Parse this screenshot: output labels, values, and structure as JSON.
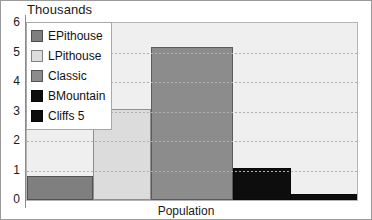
{
  "chart_data": {
    "type": "bar",
    "title": "Thousands",
    "xlabel": "Population",
    "ylabel": "",
    "ylim": [
      0,
      6
    ],
    "yticks": [
      0,
      1,
      2,
      3,
      4,
      5,
      6
    ],
    "grid": true,
    "legend_position": "top-left-inside",
    "categories": [
      "EPithouse",
      "LPithouse",
      "Classic",
      "BMountain",
      "Cliffs 5"
    ],
    "values": [
      0.8,
      3.1,
      5.2,
      1.1,
      0.2
    ],
    "colors": [
      "#7f7f7f",
      "#dcdcdc",
      "#8c8c8c",
      "#0d0d0d",
      "#0d0d0d"
    ],
    "series": [
      {
        "name": "Population",
        "values": [
          0.8,
          3.1,
          5.2,
          1.1,
          0.2
        ]
      }
    ],
    "bars": [
      {
        "label": "EPithouse",
        "value": 0.8,
        "color": "#7f7f7f"
      },
      {
        "label": "LPithouse",
        "value": 3.1,
        "color": "#dcdcdc"
      },
      {
        "label": "Classic",
        "value": 5.2,
        "color": "#8c8c8c"
      },
      {
        "label": "BMountain",
        "value": 1.1,
        "color": "#0d0d0d"
      },
      {
        "label": "Cliffs 5",
        "value": 0.2,
        "color": "#0d0d0d"
      }
    ],
    "legend": [
      {
        "label": "EPithouse",
        "color": "#7f7f7f"
      },
      {
        "label": "LPithouse",
        "color": "#dcdcdc"
      },
      {
        "label": "Classic",
        "color": "#8c8c8c"
      },
      {
        "label": "BMountain",
        "color": "#0d0d0d"
      },
      {
        "label": "Cliffs 5",
        "color": "#0d0d0d"
      }
    ],
    "plot_background": "#efefef"
  }
}
